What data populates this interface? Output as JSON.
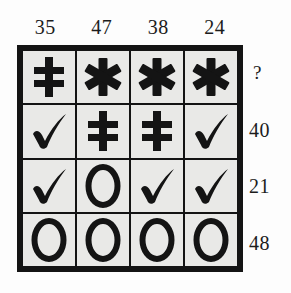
{
  "puzzle": {
    "type": "symbol-grid-sum-puzzle",
    "rows": 4,
    "columns": 4,
    "colors": {
      "background": "#fdfdfd",
      "cell_fill": "#e9e9e7",
      "border": "#141414",
      "text": "#1c1c1c"
    },
    "column_headers": [
      {
        "value": "35"
      },
      {
        "value": "47"
      },
      {
        "value": "38"
      },
      {
        "value": "24"
      }
    ],
    "row_labels": [
      {
        "value": "?",
        "unknown": true
      },
      {
        "value": "40",
        "unknown": false
      },
      {
        "value": "21",
        "unknown": false
      },
      {
        "value": "48",
        "unknown": false
      }
    ],
    "grid": [
      [
        {
          "symbol": "double-dagger",
          "glyph": "‡"
        },
        {
          "symbol": "asterisk",
          "glyph": "✱"
        },
        {
          "symbol": "asterisk",
          "glyph": "✱"
        },
        {
          "symbol": "asterisk",
          "glyph": "✱"
        }
      ],
      [
        {
          "symbol": "check",
          "glyph": "✓"
        },
        {
          "symbol": "double-dagger",
          "glyph": "‡"
        },
        {
          "symbol": "double-dagger",
          "glyph": "‡"
        },
        {
          "symbol": "check",
          "glyph": "✓"
        }
      ],
      [
        {
          "symbol": "check",
          "glyph": "✓"
        },
        {
          "symbol": "circle",
          "glyph": "O"
        },
        {
          "symbol": "check",
          "glyph": "✓"
        },
        {
          "symbol": "check",
          "glyph": "✓"
        }
      ],
      [
        {
          "symbol": "circle",
          "glyph": "O"
        },
        {
          "symbol": "circle",
          "glyph": "O"
        },
        {
          "symbol": "circle",
          "glyph": "O"
        },
        {
          "symbol": "circle",
          "glyph": "O"
        }
      ]
    ]
  }
}
